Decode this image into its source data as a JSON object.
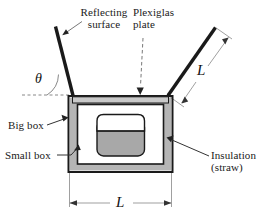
{
  "figure": {
    "background_color": "#ffffff",
    "line_color": "#1a1a1a",
    "insulation_color": "#b3b3b3",
    "plate_color": "#cccccc",
    "pot_fill_color": "#a8a8a8"
  },
  "labels": {
    "reflecting_surface_line1": "Reflecting",
    "reflecting_surface_line2": "surface",
    "plexiglas_line1": "Plexiglas",
    "plexiglas_line2": "plate",
    "big_box": "Big box",
    "small_box": "Small box",
    "insulation_line1": "Insulation",
    "insulation_line2": "(straw)",
    "theta": "θ",
    "length_right": "L",
    "length_bottom": "L"
  },
  "parts": [
    {
      "name": "left-reflector",
      "label": "Reflecting surface"
    },
    {
      "name": "right-reflector",
      "label": "Reflecting surface"
    },
    {
      "name": "plexiglas-plate",
      "label": "Plexiglas plate"
    },
    {
      "name": "big-box",
      "label": "Big box"
    },
    {
      "name": "small-box",
      "label": "Small box"
    },
    {
      "name": "insulation",
      "label": "Insulation (straw)"
    },
    {
      "name": "cooking-pot",
      "label": "Cooking pot"
    }
  ],
  "dimensions": [
    {
      "name": "reflector-length",
      "symbol": "L"
    },
    {
      "name": "box-width",
      "symbol": "L"
    },
    {
      "name": "reflector-angle",
      "symbol": "θ"
    }
  ]
}
